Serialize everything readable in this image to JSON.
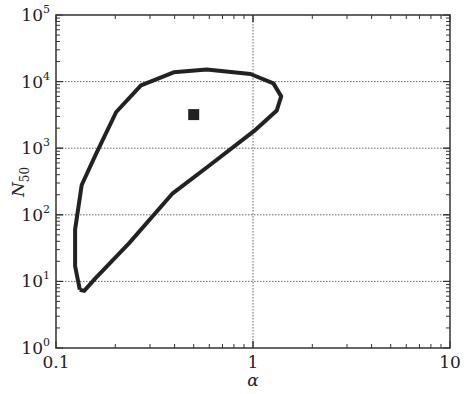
{
  "chart_data": {
    "type": "line",
    "title": "",
    "xlabel": "α",
    "ylabel": "N50",
    "ylabel_main": "N",
    "ylabel_sub": "50",
    "xscale": "log",
    "yscale": "log",
    "xlim": [
      0.1,
      10
    ],
    "ylim": [
      1,
      100000
    ],
    "grid": "dotted at major decades",
    "x_ticks": [
      "0.1",
      "1",
      "10"
    ],
    "y_ticks": [
      {
        "base": "10",
        "exp": "0"
      },
      {
        "base": "10",
        "exp": "1"
      },
      {
        "base": "10",
        "exp": "2"
      },
      {
        "base": "10",
        "exp": "3"
      },
      {
        "base": "10",
        "exp": "4"
      },
      {
        "base": "10",
        "exp": "5"
      }
    ],
    "series": [
      {
        "name": "confidence contour",
        "style": "closed curve, thick black",
        "x": [
          0.132,
          0.125,
          0.125,
          0.135,
          0.159,
          0.202,
          0.27,
          0.396,
          0.582,
          0.97,
          1.27,
          1.39,
          1.32,
          1.01,
          0.596,
          0.391,
          0.234,
          0.158,
          0.139,
          0.132
        ],
        "y": [
          7.5,
          17,
          60,
          280,
          800,
          3500,
          8800,
          13800,
          15200,
          13000,
          9400,
          6000,
          3700,
          1800,
          540,
          210,
          37,
          11,
          7.2,
          7.5
        ]
      },
      {
        "name": "best estimate",
        "style": "filled square marker",
        "x": [
          0.5
        ],
        "y": [
          3200
        ]
      }
    ]
  }
}
